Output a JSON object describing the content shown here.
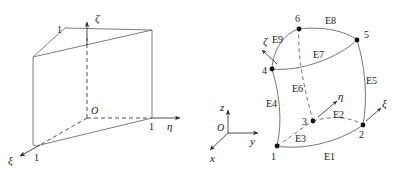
{
  "figure": {
    "panels": [
      {
        "id": "parent-element",
        "name": "parent-wedge-natural-coordinates",
        "origin_label": "O",
        "axes": [
          {
            "name": "xi",
            "label": "ξ",
            "unit_label": "1"
          },
          {
            "name": "eta",
            "label": "η",
            "unit_label": "1"
          },
          {
            "name": "zeta",
            "label": "ζ",
            "unit_label": "1"
          }
        ]
      },
      {
        "id": "mapped-element",
        "name": "curved-wedge-global-coordinates",
        "origin_label": "O",
        "global_axes": [
          {
            "name": "x",
            "label": "x"
          },
          {
            "name": "y",
            "label": "y"
          },
          {
            "name": "z",
            "label": "z"
          }
        ],
        "local_axes": [
          {
            "name": "xi",
            "label": "ξ"
          },
          {
            "name": "eta",
            "label": "η"
          },
          {
            "name": "zeta",
            "label": "ζ"
          }
        ],
        "nodes": [
          {
            "id": "1",
            "label": "1"
          },
          {
            "id": "2",
            "label": "2"
          },
          {
            "id": "3",
            "label": "3"
          },
          {
            "id": "4",
            "label": "4"
          },
          {
            "id": "5",
            "label": "5"
          },
          {
            "id": "6",
            "label": "6"
          }
        ],
        "edges": [
          {
            "id": "E1",
            "label": "E1"
          },
          {
            "id": "E2",
            "label": "E2"
          },
          {
            "id": "E3",
            "label": "E3"
          },
          {
            "id": "E4",
            "label": "E4"
          },
          {
            "id": "E5",
            "label": "E5"
          },
          {
            "id": "E6",
            "label": "E6"
          },
          {
            "id": "E7",
            "label": "E7"
          },
          {
            "id": "E8",
            "label": "E8"
          },
          {
            "id": "E9",
            "label": "E9"
          }
        ]
      }
    ],
    "colors": {
      "line": "#6e6e6e",
      "curve": "#777777",
      "axis": "#3a3a3a",
      "node": "#111111",
      "text": "#1a1a1a",
      "background": "#ffffff"
    }
  }
}
